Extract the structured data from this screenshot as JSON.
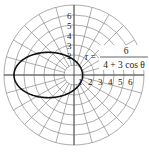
{
  "chart_data": {
    "type": "line",
    "subtype": "polar",
    "title": "",
    "equation": {
      "lhs": "r =",
      "numerator": "6",
      "denominator": "4 + 3 cos θ"
    },
    "function": "r = 6 / (4 + 3 cos θ)",
    "theta_range": [
      0,
      6.283185
    ],
    "radial_ticks": [
      "1",
      "2",
      "3",
      "4",
      "5",
      "6"
    ],
    "x_axis_tick_labels": [
      "1",
      "2",
      "3",
      "4",
      "5",
      "6"
    ],
    "y_axis_tick_labels": [
      "1",
      "2",
      "3",
      "4",
      "5",
      "6"
    ],
    "rmax": 7,
    "angular_divisions": 24,
    "grid": true,
    "sample_points": [
      {
        "theta_deg": 0,
        "r": 0.857
      },
      {
        "theta_deg": 90,
        "r": 1.5
      },
      {
        "theta_deg": 180,
        "r": 6.0
      },
      {
        "theta_deg": 270,
        "r": 1.5
      }
    ]
  },
  "layout": {
    "center_x": 74,
    "center_y": 75,
    "px_per_unit": 10,
    "colors": {
      "grid": "#8a8a8a",
      "curve": "#111111",
      "text": "#222222"
    }
  }
}
